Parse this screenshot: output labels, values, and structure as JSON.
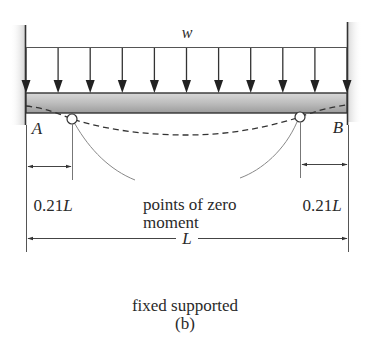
{
  "diagram": {
    "load_label": "w",
    "support_left_label": "A",
    "support_right_label": "B",
    "left_offset_label": "0.21L",
    "right_offset_label": "0.21L",
    "annotation_line1": "points of zero",
    "annotation_line2": "moment",
    "span_label": "L",
    "arrow_count": 11,
    "colors": {
      "line": "#333333",
      "beam_fill": "#b8b8b8",
      "beam_shade": "#9a9a9a",
      "wall_shade": "#d0d0d0",
      "dash": "#333333"
    }
  },
  "caption": {
    "title": "fixed supported",
    "sublabel": "(b)"
  }
}
